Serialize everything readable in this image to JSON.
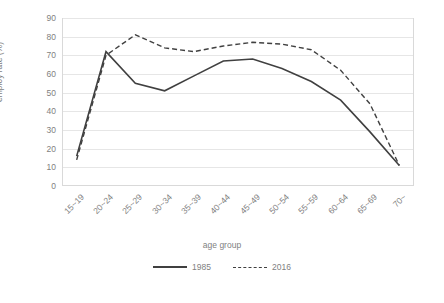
{
  "chart_data": {
    "type": "line",
    "title": "",
    "xlabel": "age group",
    "ylabel": "employ rate (%)",
    "ylim": [
      0,
      90
    ],
    "yticks": [
      0,
      10,
      20,
      30,
      40,
      50,
      60,
      70,
      80,
      90
    ],
    "grid": true,
    "legend_position": "bottom",
    "categories": [
      "15~19",
      "20~24",
      "25~29",
      "30~34",
      "35~39",
      "40~44",
      "45~49",
      "50~54",
      "55~59",
      "60~64",
      "65~69",
      "70~"
    ],
    "series": [
      {
        "name": "1985",
        "style": "solid",
        "color": "#404040",
        "values": [
          16,
          72,
          55,
          51,
          59,
          67,
          68,
          63,
          56,
          46,
          29,
          11
        ]
      },
      {
        "name": "2016",
        "style": "dashed",
        "color": "#404040",
        "values": [
          14,
          70,
          81,
          74,
          72,
          75,
          77,
          76,
          73,
          62,
          44,
          11
        ]
      }
    ]
  },
  "legend": {
    "items": [
      {
        "label": "1985"
      },
      {
        "label": "2016"
      }
    ]
  }
}
